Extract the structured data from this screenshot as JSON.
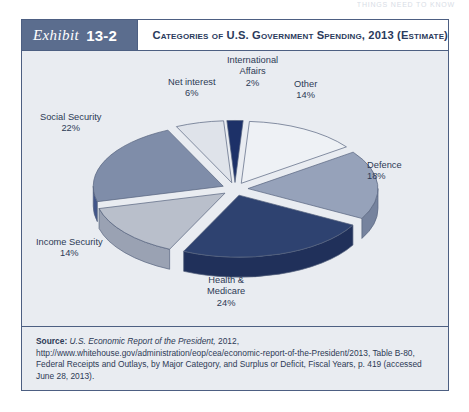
{
  "running_header": "THINGS NEED TO KNOW",
  "exhibit": {
    "label_word": "Exhibit",
    "number": "13-2",
    "title": "Categories of U.S. Government Spending, 2013 (Estimate)"
  },
  "source": {
    "lead": "Source:",
    "italic_part": "U.S. Economic Report of the President,",
    "rest": " 2012, http://www.whitehouse.gov/administration/eop/cea/economic-report-of-the-President/2013, Table B-80, Federal Receipts and Outlays, by Major Category, and Surplus or Deficit, Fiscal Years, p. 419 (accessed June 28, 2013)."
  },
  "colors": {
    "frame_border": "#4d5f82",
    "tag_background": "#5b6d8e",
    "panel_background": "#e9ecf1",
    "text_blue": "#2d3a55",
    "slice_health_medicare": "#2e4270",
    "slice_income_security": "#b9bfcb",
    "slice_social_security": "#7f8da9",
    "slice_net_interest": "#dfe3ea",
    "slice_international_affairs": "#1d3168",
    "slice_other": "#eef1f5",
    "slice_defence": "#96a2ba"
  },
  "chart_data": {
    "type": "pie",
    "title": "Categories of U.S. Government Spending, 2013 (Estimate)",
    "exploded": true,
    "three_d": true,
    "legend": "none",
    "labels_position": "outside",
    "categories": [
      "Health & Medicare",
      "Income Security",
      "Social Security",
      "Net interest",
      "International Affairs",
      "Other",
      "Defence"
    ],
    "values": [
      24,
      14,
      22,
      6,
      2,
      14,
      18
    ],
    "value_suffix": "%",
    "slices": [
      {
        "name": "Health & Medicare",
        "value": 24,
        "display": "24%",
        "label_line1": "Health &",
        "label_line2": "Medicare",
        "label_line3": "24%",
        "color": "#2e4270",
        "side_color": "#20305a"
      },
      {
        "name": "Income Security",
        "value": 14,
        "display": "14%",
        "label_line1": "Income Security",
        "label_line2": "14%",
        "label_line3": "",
        "color": "#b9bfcb",
        "side_color": "#9aa2b3"
      },
      {
        "name": "Social Security",
        "value": 22,
        "display": "22%",
        "label_line1": "Social Security",
        "label_line2": "22%",
        "label_line3": "",
        "color": "#7f8da9",
        "side_color": "#41558a"
      },
      {
        "name": "Net interest",
        "value": 6,
        "display": "6%",
        "label_line1": "Net interest",
        "label_line2": "6%",
        "label_line3": "",
        "color": "#dfe3ea",
        "side_color": "#b6bcc9"
      },
      {
        "name": "International Affairs",
        "value": 2,
        "display": "2%",
        "label_line1": "International",
        "label_line2": "Affairs",
        "label_line3": "2%",
        "color": "#1d3168",
        "side_color": "#15234b"
      },
      {
        "name": "Other",
        "value": 14,
        "display": "14%",
        "label_line1": "Other",
        "label_line2": "14%",
        "label_line3": "",
        "color": "#eef1f5",
        "side_color": "#c2c8d4"
      },
      {
        "name": "Defence",
        "value": 18,
        "display": "18%",
        "label_line1": "Defence",
        "label_line2": "18%",
        "label_line3": "",
        "color": "#96a2ba",
        "side_color": "#76839e"
      }
    ]
  }
}
